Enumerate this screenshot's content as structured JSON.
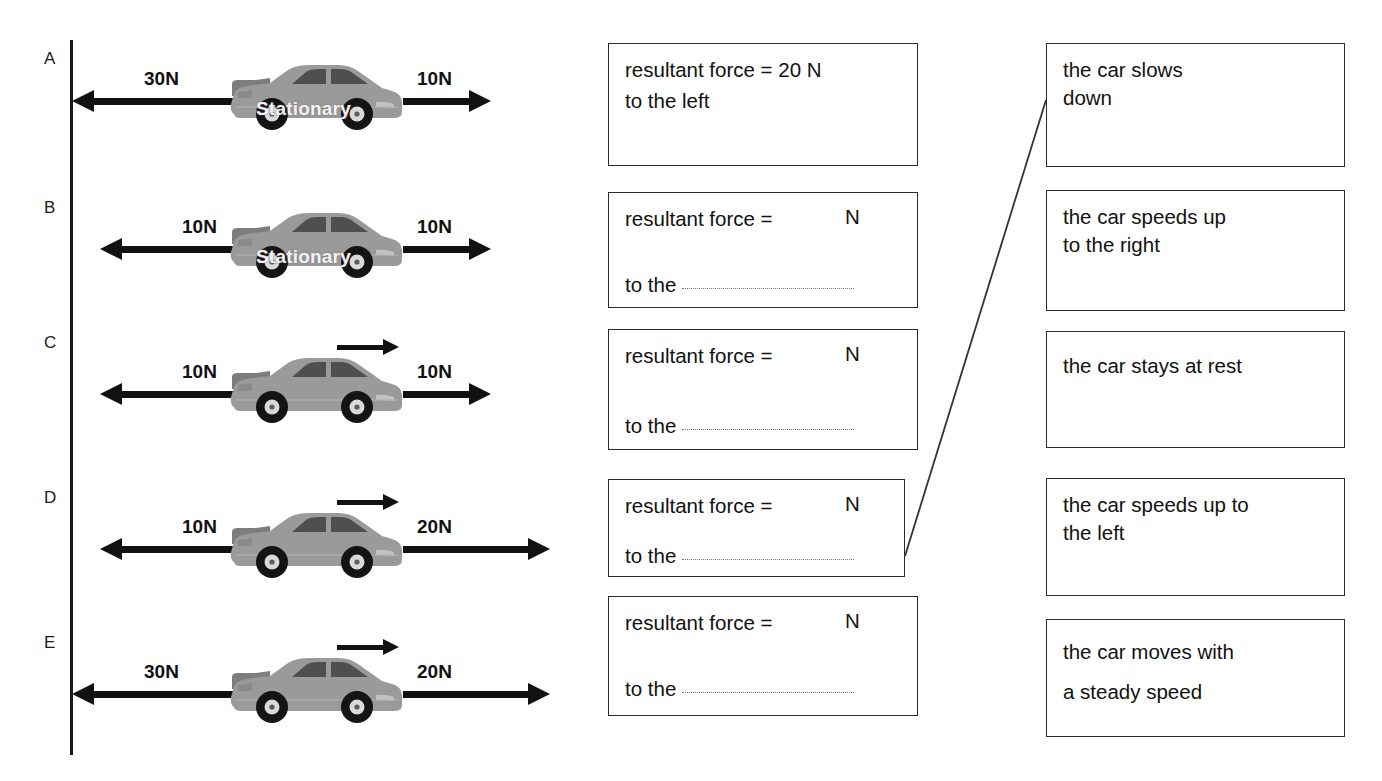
{
  "diagram": {
    "wall_label": "wall",
    "stationary_text": "Stationary"
  },
  "rows": [
    {
      "id": "A",
      "label": "A",
      "left_force": "30N",
      "right_force": "10N",
      "car_state": "Stationary",
      "has_motion_arrow": false,
      "answer": {
        "line1": "resultant force = 20 N",
        "line2": "to the left",
        "filled": true,
        "value": "20",
        "unit": "N",
        "direction": "left"
      }
    },
    {
      "id": "B",
      "label": "B",
      "left_force": "10N",
      "right_force": "10N",
      "car_state": "Stationary",
      "has_motion_arrow": false,
      "answer": {
        "line1": "resultant force =",
        "line2": "to the",
        "filled": false,
        "value": "",
        "unit": "N",
        "direction": ""
      }
    },
    {
      "id": "C",
      "label": "C",
      "left_force": "10N",
      "right_force": "10N",
      "car_state": "",
      "has_motion_arrow": true,
      "answer": {
        "line1": "resultant force =",
        "line2": "to the",
        "filled": false,
        "value": "",
        "unit": "N",
        "direction": ""
      }
    },
    {
      "id": "D",
      "label": "D",
      "left_force": "10N",
      "right_force": "20N",
      "car_state": "",
      "has_motion_arrow": true,
      "answer": {
        "line1": "resultant force =",
        "line2": "to the",
        "filled": false,
        "value": "",
        "unit": "N",
        "direction": ""
      }
    },
    {
      "id": "E",
      "label": "E",
      "left_force": "30N",
      "right_force": "20N",
      "car_state": "",
      "has_motion_arrow": true,
      "answer": {
        "line1": "resultant force =",
        "line2": "to the",
        "filled": false,
        "value": "",
        "unit": "N",
        "direction": ""
      }
    }
  ],
  "outcomes": [
    {
      "id": "outcome-1",
      "line1": "the car slows",
      "line2": "down"
    },
    {
      "id": "outcome-2",
      "line1": "the car speeds up",
      "line2": "to the right"
    },
    {
      "id": "outcome-3",
      "line1": "the car stays at rest",
      "line2": ""
    },
    {
      "id": "outcome-4",
      "line1": "the car speeds up to",
      "line2": "the left"
    },
    {
      "id": "outcome-5",
      "line1": " the car moves with",
      "line2": "a steady speed"
    }
  ],
  "connection": {
    "from_row": "D",
    "to_outcome": "outcome-1",
    "color": "#333333"
  },
  "colors": {
    "ink": "#111111",
    "box_border": "#2b2b2b",
    "car_body": "#9a9a9a",
    "car_dark": "#5c5c5c",
    "tire": "#141414",
    "hubcap": "#d9d9d9",
    "dotted_rule": "#777777"
  }
}
